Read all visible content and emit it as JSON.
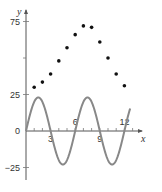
{
  "chart_data": {
    "type": "scatter",
    "title": "",
    "xlabel": "x",
    "ylabel": "y",
    "xlim": [
      0,
      13
    ],
    "ylim": [
      -35,
      85
    ],
    "x_ticks": [
      3,
      6,
      9,
      12
    ],
    "x_tick_labels": [
      "3",
      "6",
      "9",
      "12"
    ],
    "y_ticks": [
      75,
      25,
      0,
      -25
    ],
    "y_tick_labels": [
      "75",
      "25",
      "0",
      "−25"
    ],
    "grid": false,
    "series": [
      {
        "name": "data points",
        "kind": "scatter",
        "x": [
          1,
          2,
          3,
          4,
          5,
          6,
          7,
          8,
          9,
          10,
          11,
          12
        ],
        "y": [
          30,
          33.5,
          39,
          48,
          57,
          66,
          72,
          71,
          61,
          50,
          39,
          31
        ]
      },
      {
        "name": "sine curve",
        "kind": "line",
        "equation": "y = 23 sin(πx/3)",
        "amplitude": 23,
        "period": 6,
        "x_range": [
          0,
          12.7
        ],
        "color": "#888888"
      }
    ]
  },
  "axes": {
    "x_label": "x",
    "y_label": "y",
    "origin_label": "0"
  }
}
